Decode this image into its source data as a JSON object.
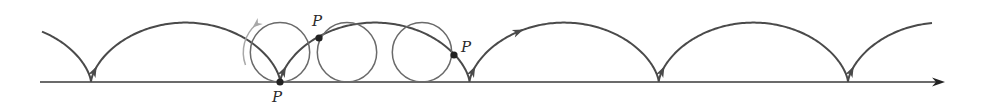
{
  "diagram": {
    "type": "cycloid",
    "colors": {
      "curve": "#4a4a4a",
      "circle": "#6a6a6a",
      "axis": "#3a3a3a",
      "rotation_arrow": "#a8a8a8",
      "point": "#222222"
    },
    "geometry": {
      "baseline_y": 82,
      "radius": 29.7,
      "cusps_x": [
        91,
        280,
        468,
        658,
        848
      ],
      "axis_x_start": 40,
      "axis_x_end": 945,
      "curve_x_start": 42,
      "curve_x_end": 932
    },
    "circles": [
      {
        "cx": 280,
        "label": "circle-1"
      },
      {
        "cx": 347,
        "label": "circle-2"
      },
      {
        "cx": 422,
        "label": "circle-3"
      }
    ],
    "points": [
      {
        "label": "P",
        "x": 280,
        "y": 82,
        "label_x": 272,
        "label_y": 102
      },
      {
        "label": "P",
        "x": 319,
        "y": 38,
        "label_x": 312,
        "label_y": 26
      },
      {
        "label": "P",
        "x": 454,
        "y": 55,
        "label_x": 461,
        "label_y": 52
      }
    ]
  }
}
